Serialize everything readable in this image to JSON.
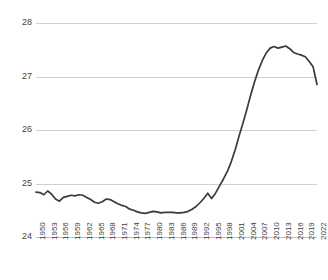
{
  "chart_data": {
    "type": "line",
    "title": "",
    "xlabel": "",
    "ylabel": "",
    "ylim": [
      24,
      28
    ],
    "xlim": [
      1950,
      2022
    ],
    "grid": true,
    "legend": "none",
    "line_color": "#3a3a3a",
    "gridline_color": "#d0d0d0",
    "background": "#ffffff",
    "yticks": [
      "28",
      "27",
      "26",
      "25",
      "24"
    ],
    "ytick_values": [
      28,
      27,
      26,
      25,
      24
    ],
    "xticks": [
      "1950",
      "1953",
      "1956",
      "1959",
      "1962",
      "1965",
      "1968",
      "1971",
      "1974",
      "1977",
      "1980",
      "1983",
      "1986",
      "1989",
      "1992",
      "1995",
      "1998",
      "2001",
      "2004",
      "2007",
      "2010",
      "2013",
      "2016",
      "2019",
      "2022"
    ],
    "xtick_values": [
      1950,
      1953,
      1956,
      1959,
      1962,
      1965,
      1968,
      1971,
      1974,
      1977,
      1980,
      1983,
      1986,
      1989,
      1992,
      1995,
      1998,
      2001,
      2004,
      2007,
      2010,
      2013,
      2016,
      2019,
      2022
    ],
    "series": [
      {
        "name": "value",
        "x": [
          1950,
          1951,
          1952,
          1953,
          1954,
          1955,
          1956,
          1957,
          1958,
          1959,
          1960,
          1961,
          1962,
          1963,
          1964,
          1965,
          1966,
          1967,
          1968,
          1969,
          1970,
          1971,
          1972,
          1973,
          1974,
          1975,
          1976,
          1977,
          1978,
          1979,
          1980,
          1981,
          1982,
          1983,
          1984,
          1985,
          1986,
          1987,
          1988,
          1989,
          1990,
          1991,
          1992,
          1993,
          1994,
          1995,
          1996,
          1997,
          1998,
          1999,
          2000,
          2001,
          2002,
          2003,
          2004,
          2005,
          2006,
          2007,
          2008,
          2009,
          2010,
          2011,
          2012,
          2013,
          2014,
          2015,
          2016,
          2017,
          2018,
          2019,
          2020,
          2021,
          2022
        ],
        "values": [
          24.84,
          24.83,
          24.79,
          24.86,
          24.8,
          24.71,
          24.67,
          24.74,
          24.76,
          24.78,
          24.77,
          24.79,
          24.78,
          24.74,
          24.7,
          24.65,
          24.63,
          24.66,
          24.71,
          24.7,
          24.66,
          24.62,
          24.59,
          24.57,
          24.52,
          24.5,
          24.47,
          24.45,
          24.44,
          24.46,
          24.48,
          24.47,
          24.45,
          24.46,
          24.46,
          24.46,
          24.45,
          24.45,
          24.46,
          24.48,
          24.52,
          24.57,
          24.64,
          24.72,
          24.82,
          24.72,
          24.82,
          24.95,
          25.08,
          25.22,
          25.4,
          25.62,
          25.88,
          26.12,
          26.38,
          26.65,
          26.9,
          27.12,
          27.3,
          27.44,
          27.53,
          27.56,
          27.53,
          27.55,
          27.57,
          27.52,
          27.45,
          27.42,
          27.4,
          27.37,
          27.28,
          27.18,
          26.85
        ]
      }
    ]
  }
}
